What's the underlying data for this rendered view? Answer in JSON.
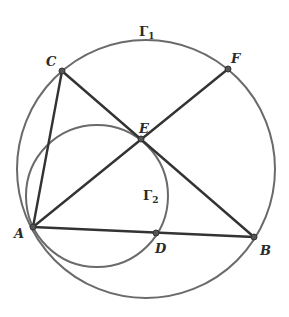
{
  "figure": {
    "circles": [
      {
        "name": "Γ",
        "subscript": "1",
        "cx": 146,
        "cy": 169,
        "r": 128
      },
      {
        "name": "Γ",
        "subscript": "2",
        "cx": 98,
        "cy": 196,
        "r": 71
      }
    ],
    "points": {
      "A": {
        "label": "A",
        "x": 33,
        "y": 227
      },
      "B": {
        "label": "B",
        "x": 254,
        "y": 237
      },
      "C": {
        "label": "C",
        "x": 62,
        "y": 71
      },
      "D": {
        "label": "D",
        "x": 156,
        "y": 233
      },
      "E": {
        "label": "E",
        "x": 141,
        "y": 139
      },
      "F": {
        "label": "F",
        "x": 228,
        "y": 69
      }
    },
    "segments": [
      "AC",
      "CB",
      "AF",
      "AB"
    ],
    "colors": {
      "circle": "#6a6a6a",
      "segment": "#333333",
      "label": "#2a2a2a"
    }
  }
}
